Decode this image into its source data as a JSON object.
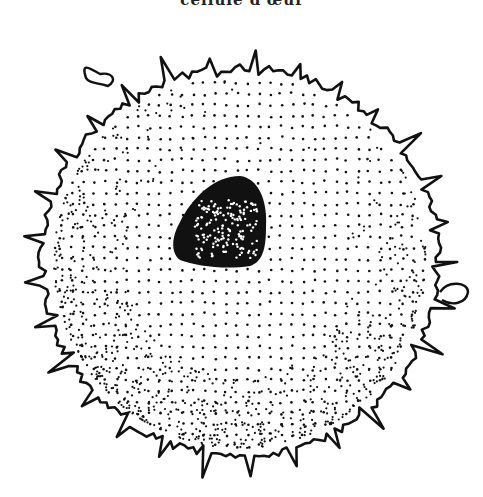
{
  "figure": {
    "caption_clipped": "cellule d'œuf",
    "colors": {
      "ink": "#111111",
      "background": "#ffffff"
    },
    "cell": {
      "cx": 240,
      "cy": 262,
      "r": 190
    },
    "nucleus": {
      "cx": 225,
      "cy": 222
    }
  }
}
